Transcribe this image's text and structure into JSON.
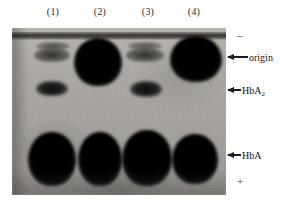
{
  "figure": {
    "type": "hemoglobin-electrophoresis-gel",
    "width": 283,
    "height": 207,
    "background_color": "#ffffff"
  },
  "lanes": [
    {
      "label": "(1)",
      "left": 42,
      "center_x": 53
    },
    {
      "label": "(2)",
      "left": 89,
      "center_x": 100
    },
    {
      "label": "(3)",
      "left": 137,
      "center_x": 148
    },
    {
      "label": "(4)",
      "left": 183,
      "center_x": 194
    }
  ],
  "annotations": [
    {
      "label": "origin",
      "sub": "",
      "name": "origin",
      "y": 51,
      "arrow_x": 228,
      "arrow_len": 20
    },
    {
      "label": "HbA",
      "sub": "2",
      "name": "hba2",
      "y": 84,
      "arrow_x": 228,
      "arrow_len": 13
    },
    {
      "label": "HbA",
      "sub": "",
      "name": "hba",
      "y": 149,
      "arrow_x": 228,
      "arrow_len": 13
    }
  ],
  "polarity": {
    "negative": "–",
    "positive": "+",
    "negative_pos": {
      "x": 237,
      "y": 30
    },
    "positive_pos": {
      "x": 237,
      "y": 176
    }
  },
  "gel": {
    "left": 12,
    "top": 28,
    "width": 214,
    "height": 167,
    "base_color": "#aca9a4",
    "band_color": "#000000"
  },
  "bands": [
    {
      "lane": 1,
      "row": "origin",
      "intensity": "faint",
      "left": 22,
      "top": 20,
      "width": 36,
      "height": 14
    },
    {
      "lane": 1,
      "row": "hba2",
      "intensity": "mid",
      "left": 24,
      "top": 53,
      "width": 32,
      "height": 15
    },
    {
      "lane": 1,
      "row": "hba",
      "intensity": "blob",
      "left": 16,
      "top": 104,
      "width": 48,
      "height": 54
    },
    {
      "lane": 2,
      "row": "origin",
      "intensity": "blob",
      "left": 62,
      "top": 10,
      "width": 48,
      "height": 48
    },
    {
      "lane": 2,
      "row": "hba",
      "intensity": "blob",
      "left": 66,
      "top": 104,
      "width": 44,
      "height": 54
    },
    {
      "lane": 3,
      "row": "origin",
      "intensity": "faint",
      "left": 114,
      "top": 20,
      "width": 38,
      "height": 14
    },
    {
      "lane": 3,
      "row": "hba2",
      "intensity": "mid",
      "left": 118,
      "top": 53,
      "width": 32,
      "height": 16
    },
    {
      "lane": 3,
      "row": "hba",
      "intensity": "blob",
      "left": 110,
      "top": 102,
      "width": 50,
      "height": 56
    },
    {
      "lane": 4,
      "row": "origin",
      "intensity": "blob",
      "left": 158,
      "top": 8,
      "width": 52,
      "height": 46
    },
    {
      "lane": 4,
      "row": "hba",
      "intensity": "blob",
      "left": 160,
      "top": 106,
      "width": 46,
      "height": 50
    }
  ]
}
